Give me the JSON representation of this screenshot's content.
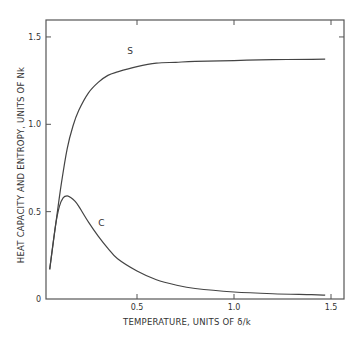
{
  "chart_data": {
    "type": "line",
    "title": "",
    "xlabel": "TEMPERATURE, UNITS OF δ/k",
    "ylabel": "HEAT CAPACITY AND ENTROPY, UNITS OF Nk",
    "xlim": [
      0,
      1.55
    ],
    "ylim": [
      0,
      1.6
    ],
    "xticks": [
      {
        "value": 0.5,
        "label": "0.5"
      },
      {
        "value": 1.0,
        "label": "1.0"
      },
      {
        "value": 1.5,
        "label": "1.5"
      }
    ],
    "yticks": [
      {
        "value": 0,
        "label": "0"
      },
      {
        "value": 0.5,
        "label": "0.5"
      },
      {
        "value": 1.0,
        "label": "1.0"
      },
      {
        "value": 1.5,
        "label": "1.5"
      }
    ],
    "grid": false,
    "legend": "none",
    "series": [
      {
        "name": "S",
        "label": "S",
        "label_at": [
          0.45,
          1.4
        ],
        "x": [
          0.05,
          0.08,
          0.11,
          0.14,
          0.17,
          0.2,
          0.25,
          0.3,
          0.35,
          0.4,
          0.5,
          0.6,
          0.7,
          0.8,
          1.0,
          1.2,
          1.4,
          1.47
        ],
        "y": [
          0.17,
          0.42,
          0.66,
          0.86,
          0.99,
          1.08,
          1.18,
          1.24,
          1.28,
          1.3,
          1.33,
          1.35,
          1.355,
          1.36,
          1.365,
          1.37,
          1.372,
          1.373
        ]
      },
      {
        "name": "C",
        "label": "C",
        "label_at": [
          0.3,
          0.42
        ],
        "x": [
          0.05,
          0.08,
          0.1,
          0.12,
          0.14,
          0.16,
          0.18,
          0.2,
          0.25,
          0.3,
          0.35,
          0.4,
          0.5,
          0.6,
          0.7,
          0.8,
          1.0,
          1.2,
          1.4,
          1.47
        ],
        "y": [
          0.17,
          0.42,
          0.53,
          0.58,
          0.59,
          0.58,
          0.56,
          0.53,
          0.44,
          0.36,
          0.29,
          0.23,
          0.16,
          0.11,
          0.08,
          0.06,
          0.04,
          0.03,
          0.025,
          0.022
        ]
      }
    ]
  }
}
